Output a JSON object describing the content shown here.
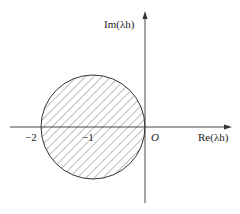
{
  "figure": {
    "axes": {
      "x_label": "Re(λh)",
      "y_label": "Im(λh)",
      "origin_label": "O"
    },
    "ticks": [
      {
        "label": "−2",
        "value": -2
      },
      {
        "label": "−1",
        "value": -1
      }
    ],
    "region": {
      "shape": "disk",
      "center": [
        -1,
        0
      ],
      "radius": 1,
      "fill": "hatched",
      "hatch_color": "#555555",
      "edge_color": "#333333"
    },
    "x_range": [
      -2.6,
      1.65
    ],
    "y_range": [
      -1.45,
      2.2
    ]
  }
}
